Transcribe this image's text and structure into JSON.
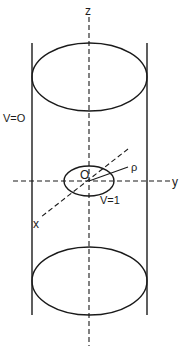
{
  "diagram": {
    "type": "cylinder-coordinate-figure",
    "labels": {
      "z_axis": "z",
      "y_axis": "y",
      "x_axis": "x",
      "origin": "O",
      "rho": "ρ",
      "outer_potential": "V=O",
      "inner_potential": "V=1"
    },
    "elements": [
      {
        "name": "cylinder-wall-left",
        "kind": "line"
      },
      {
        "name": "cylinder-wall-right",
        "kind": "line"
      },
      {
        "name": "top-ellipse",
        "kind": "ellipse"
      },
      {
        "name": "bottom-ellipse",
        "kind": "ellipse"
      },
      {
        "name": "inner-disk-ellipse",
        "kind": "ellipse"
      },
      {
        "name": "z-axis",
        "kind": "dashed-line"
      },
      {
        "name": "y-axis",
        "kind": "dashed-line"
      },
      {
        "name": "x-axis",
        "kind": "dashed-line"
      },
      {
        "name": "rho-radius-line",
        "kind": "line"
      }
    ],
    "colors": {
      "ink": "#1a1a1a",
      "background": "#ffffff"
    }
  }
}
